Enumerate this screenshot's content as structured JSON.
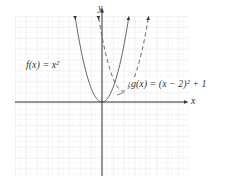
{
  "chart_data": {
    "type": "line",
    "title": "",
    "xlabel": "x",
    "ylabel": "y",
    "grid": true,
    "xlim": [
      -8,
      8
    ],
    "ylim": [
      -7,
      8
    ],
    "series": [
      {
        "name": "f(x) = x^2",
        "style": "solid",
        "vertex": [
          0,
          0
        ],
        "formula": "x^2"
      },
      {
        "name": "g(x) = (x - 2)^2 + 1",
        "style": "dashed",
        "vertex": [
          2,
          1
        ],
        "formula": "(x-2)^2+1"
      }
    ],
    "annotations": [
      "f(x) = x²",
      "g(x) = (x − 2)² + 1"
    ]
  },
  "labels": {
    "y_axis": "y",
    "x_axis": "x",
    "f_label": "f(x) = x²",
    "g_label": "g(x) = (x − 2)² + 1"
  },
  "colors": {
    "grid": "#c8c8c8",
    "axis": "#333333",
    "curve": "#555555"
  }
}
